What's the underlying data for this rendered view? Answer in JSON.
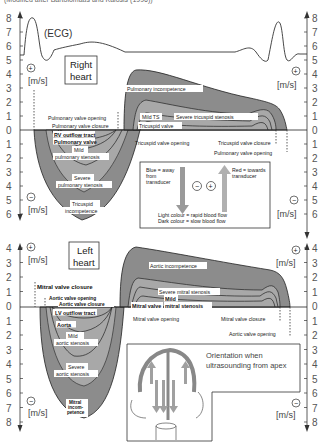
{
  "caption": "(Modified after Bartolomäus and Kalosis (1996))",
  "ecg": {
    "label": "(ECG)"
  },
  "axes": {
    "unit": "[m/s]",
    "plus": "+",
    "minus": "−",
    "top_ticks": [
      "8",
      "7",
      "6",
      "5",
      "4",
      "3",
      "2",
      "1",
      "0",
      "1",
      "2",
      "3",
      "4",
      "5",
      "6"
    ],
    "bottom_ticks": [
      "4",
      "3",
      "2",
      "1",
      "0",
      "1",
      "2",
      "3",
      "4",
      "5",
      "6",
      "7",
      "8"
    ]
  },
  "right_heart": {
    "title_line1": "Right",
    "title_line2": "heart",
    "labels": {
      "pulmonary_valve_opening": "Pulmonary valve opening",
      "pulmonary_valve_closure": "Pulmonary valve closure",
      "rv_outflow_tract": "RV outflow tract",
      "pulmonary_valve": "Pulmonary valve",
      "mild_pulm_1": "Mild",
      "mild_pulm_2": "pulmonary stenosis",
      "severe_pulm_1": "Severe",
      "severe_pulm_2": "pulmonary stenosis",
      "tric_incomp_1": "Tricuspid",
      "tric_incomp_2": "incompetence",
      "pulmonary_incompetence": "Pulmonary incompetence",
      "mild_ts": "Mild TS",
      "severe_ts": "Severe tricuspid stenosis",
      "tricuspid_valve": "Tricuspid valve",
      "tricuspid_valve_opening": "Tricuspid valve opening",
      "tricuspid_valve_closure": "Tricuspid valve closure",
      "pulmonary_valve_opening_r": "Pulmonary valve opening"
    }
  },
  "legend_box": {
    "blue_1": "Blue = away",
    "blue_2": "from",
    "blue_3": "transducer",
    "red_1": "Red = towards",
    "red_2": "transducer",
    "minus": "−",
    "plus": "+",
    "light": "Light colour = rapid blood flow",
    "dark": "Dark colour = slow blood flow"
  },
  "left_heart": {
    "title_line1": "Left",
    "title_line2": "heart",
    "labels": {
      "mitral_valve_closure": "Mitral valve closure",
      "aortic_valve_opening": "Aortic valve opening",
      "aortic_valve_closure": "Aortic valve closure",
      "lv_outflow_tract": "LV outflow tract",
      "aorta": "Aorta",
      "mild_aortic_1": "Mild",
      "mild_aortic_2": "aortic stenosis",
      "severe_aortic_1": "Severe",
      "severe_aortic_2": "aortic stenosis",
      "mitral_incomp_1": "Mitral",
      "mitral_incomp_2": "incom-",
      "mitral_incomp_3": "petence",
      "aortic_incompetence": "Aortic incompetence",
      "severe_ms": "Severe mitral stenosis",
      "mild_ms_1": "Mild",
      "mild_ms_2": "mitral stenosis",
      "mitral_valve": "Mitral valve",
      "mitral_valve_opening": "Mitral valve opening",
      "mitral_valve_closure_r": "Mitral valve closure",
      "aortic_valve_opening_r": "Aortic valve opening"
    }
  },
  "orientation_box": {
    "line1": "Orientation when",
    "line2": "ultrasounding from apex"
  },
  "colors": {
    "fill_dark": "#8c8c8c",
    "fill_mid": "#a6a6a6",
    "fill_light": "#c8c8c8",
    "line": "#222222",
    "arrow_grey": "#9a9a9a"
  }
}
